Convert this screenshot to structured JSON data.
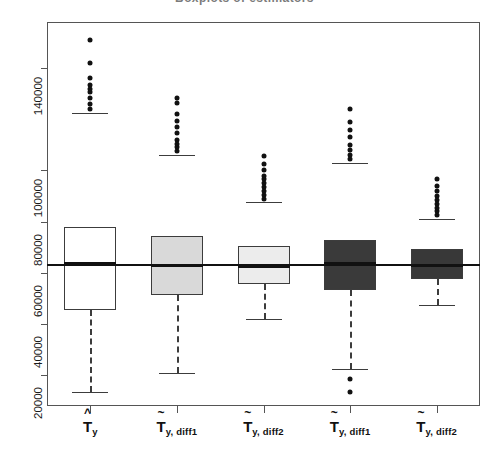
{
  "title": "Boxplots of estimators",
  "axes": {
    "y_ticks": [
      20000,
      40000,
      60000,
      80000,
      100000,
      140000
    ],
    "y_tick_labels": [
      "20000",
      "40000",
      "60000",
      "80000",
      "100000",
      "140000"
    ],
    "y_min": 8000,
    "y_max": 158000,
    "reference_line_value": 63500
  },
  "x_labels": [
    {
      "base": "T",
      "accent": "^",
      "sub": "y"
    },
    {
      "base": "T",
      "accent": "~",
      "sub": "y, diff1"
    },
    {
      "base": "T",
      "accent": "~",
      "sub": "y, diff2"
    },
    {
      "base": "T",
      "accent": "~",
      "sub": "y, diff1"
    },
    {
      "base": "T",
      "accent": "~",
      "sub": "y, diff2"
    }
  ],
  "colors": {
    "box_white": "#ffffff",
    "box_light_gray": "#d9d9d9",
    "box_pale_gray": "#ececec",
    "box_dark_gray": "#3a3a3a",
    "box_dark_gray2": "#383838",
    "line": "#3c3c3c",
    "median": "#111111",
    "reference": "#111111"
  },
  "chart_data": {
    "type": "boxplot",
    "title": "Boxplots of estimators",
    "xlabel": "",
    "ylabel": "",
    "ylim": [
      8000,
      158000
    ],
    "grid": false,
    "legend": "none",
    "reference_line": 63500,
    "categories": [
      "T_y (hat)",
      "T_y,diff1 (tilde)",
      "T_y,diff2 (tilde)",
      "T_y,diff1 (tilde)",
      "T_y,diff2 (tilde)"
    ],
    "series": [
      {
        "name": "T_y (hat)",
        "fill": "#ffffff",
        "lower_whisker": 13500,
        "q1": 45500,
        "median": 63500,
        "q3": 78000,
        "upper_whisker": 122500,
        "outliers": [
          124000,
          126000,
          128500,
          130500,
          132000,
          133500,
          136000,
          142000,
          151000
        ]
      },
      {
        "name": "T_y,diff1 (tilde)",
        "fill": "#d9d9d9",
        "lower_whisker": 21000,
        "q1": 51500,
        "median": 63000,
        "q3": 74500,
        "upper_whisker": 106000,
        "outliers": [
          107500,
          109000,
          110500,
          112000,
          114500,
          117000,
          119500,
          122000,
          126500,
          128500
        ]
      },
      {
        "name": "T_y,diff2 (tilde)",
        "fill": "#ececec",
        "lower_whisker": 42000,
        "q1": 55500,
        "median": 62500,
        "q3": 70500,
        "upper_whisker": 87500,
        "outliers": [
          89000,
          90500,
          92000,
          93500,
          95000,
          96500,
          98000,
          100000,
          102500,
          105500
        ]
      },
      {
        "name": "T_y,diff1 (tilde)",
        "fill": "#3a3a3a",
        "lower_whisker": 22500,
        "q1": 53500,
        "median": 63500,
        "q3": 73000,
        "upper_whisker": 103000,
        "outliers": [
          104500,
          106000,
          108000,
          110000,
          113000,
          116000,
          119000,
          124000,
          18500,
          13500
        ]
      },
      {
        "name": "T_y,diff2 (tilde)",
        "fill": "#383838",
        "lower_whisker": 47500,
        "q1": 57500,
        "median": 63000,
        "q3": 69500,
        "upper_whisker": 81000,
        "outliers": [
          82500,
          84000,
          85500,
          87000,
          88500,
          90000,
          92000,
          94000,
          96500
        ]
      }
    ]
  }
}
